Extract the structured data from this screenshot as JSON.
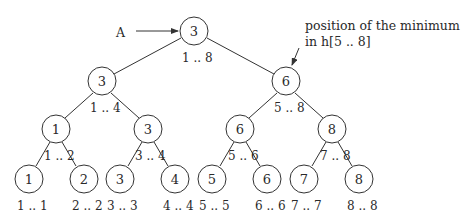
{
  "diagram": {
    "pointer_label": "A",
    "annotation": {
      "line1": "position of the minimum",
      "line2": "in h[5 .. 8]"
    },
    "nodes": [
      {
        "id": "n1",
        "value": "3",
        "range": "1 .. 8"
      },
      {
        "id": "n2",
        "value": "3",
        "range": "1 .. 4"
      },
      {
        "id": "n3",
        "value": "6",
        "range": "5 .. 8"
      },
      {
        "id": "n4",
        "value": "1",
        "range": "1 .. 2"
      },
      {
        "id": "n5",
        "value": "3",
        "range": "3 .. 4"
      },
      {
        "id": "n6",
        "value": "6",
        "range": "5 .. 6"
      },
      {
        "id": "n7",
        "value": "8",
        "range": "7 .. 8"
      },
      {
        "id": "n8",
        "value": "1",
        "range": "1 .. 1"
      },
      {
        "id": "n9",
        "value": "2",
        "range": "2 .. 2"
      },
      {
        "id": "n10",
        "value": "3",
        "range": "3 .. 3"
      },
      {
        "id": "n11",
        "value": "4",
        "range": "4 .. 4"
      },
      {
        "id": "n12",
        "value": "5",
        "range": "5 .. 5"
      },
      {
        "id": "n13",
        "value": "6",
        "range": "6 .. 6"
      },
      {
        "id": "n14",
        "value": "7",
        "range": "7 .. 7"
      },
      {
        "id": "n15",
        "value": "8",
        "range": "8 .. 8"
      }
    ]
  }
}
